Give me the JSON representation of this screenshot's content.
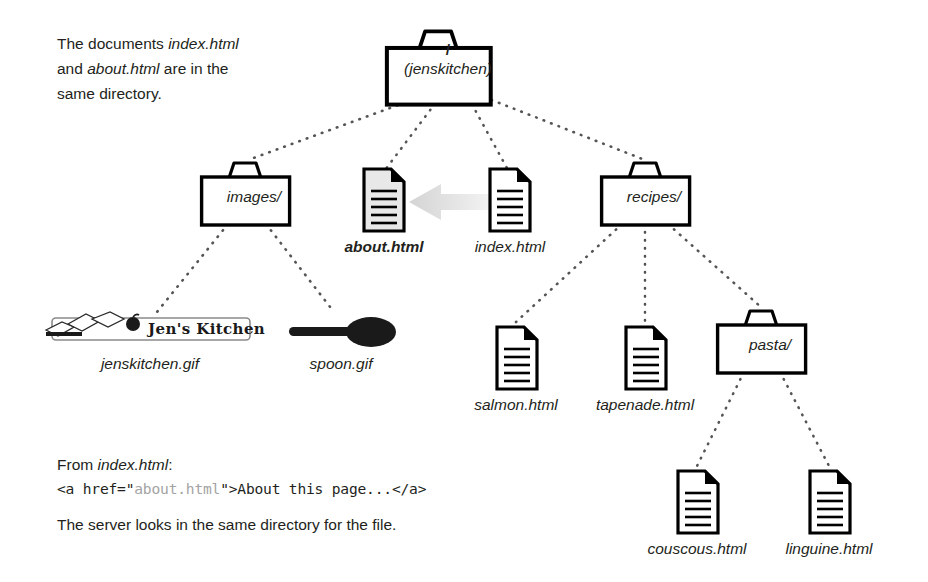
{
  "document": {
    "title": "Relative URL directory tree — jenskitchen",
    "background_color": "#ffffff",
    "text_color": "#231f20"
  },
  "annotations": {
    "intro": {
      "line1_prefix": "The documents ",
      "line1_em": "index.html",
      "line2_prefix": "and ",
      "line2_em": "about.html",
      "line2_suffix": " are in the",
      "line3": "same directory."
    },
    "from_label": {
      "prefix": "From ",
      "em": "index.html",
      "suffix": ":"
    },
    "code": {
      "before_string": "<a href=\"",
      "string": "about.html",
      "after_string": "\">About this page...</a>",
      "string_color": "#a3a3a3"
    },
    "footer": "The server looks in the same directory for the file."
  },
  "tree": {
    "root": {
      "name": "root-folder",
      "line1": "/",
      "line2": "(jenskitchen)",
      "type": "folder"
    },
    "level2": [
      {
        "name": "images-folder",
        "label": "images/",
        "type": "folder"
      },
      {
        "name": "about-html-doc",
        "label": "about.html",
        "type": "document",
        "highlighted": true,
        "bold_label": true
      },
      {
        "name": "index-html-doc",
        "label": "index.html",
        "type": "document",
        "highlighted": false,
        "bold_label": false
      },
      {
        "name": "recipes-folder",
        "label": "recipes/",
        "type": "folder"
      }
    ],
    "images_children": [
      {
        "name": "jenskitchen-gif",
        "label": "jenskitchen.gif",
        "type": "image",
        "image_text": "Jen's Kitchen"
      },
      {
        "name": "spoon-gif",
        "label": "spoon.gif",
        "type": "image"
      }
    ],
    "recipes_children": [
      {
        "name": "salmon-html-doc",
        "label": "salmon.html",
        "type": "document"
      },
      {
        "name": "tapenade-html-doc",
        "label": "tapenade.html",
        "type": "document"
      },
      {
        "name": "pasta-folder",
        "label": "pasta/",
        "type": "folder"
      }
    ],
    "pasta_children": [
      {
        "name": "couscous-html-doc",
        "label": "couscous.html",
        "type": "document"
      },
      {
        "name": "linguine-html-doc",
        "label": "linguine.html",
        "type": "document"
      }
    ]
  },
  "arrow": {
    "name": "reference-arrow",
    "direction": "left",
    "from": "index.html",
    "to": "about.html",
    "color": "#e2e2e2"
  },
  "colors": {
    "stroke": "#000000",
    "highlight_fill": "#e8e8e8",
    "dotted_connector": "#555555",
    "code_string": "#a3a3a3",
    "arrow": "#e2e2e2"
  }
}
